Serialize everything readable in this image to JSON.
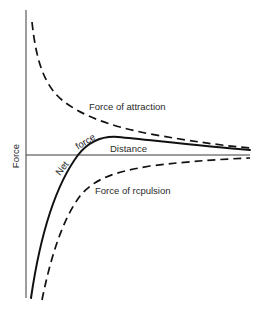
{
  "diagram": {
    "y_axis_label": "Force",
    "x_axis_label": "Distance",
    "curves": {
      "attraction": {
        "label": "Force of attraction",
        "style": "dashed"
      },
      "repulsion": {
        "label": "Force of rcpulsion",
        "style": "dashed"
      },
      "net": {
        "label_part1": "Net",
        "label_part2": "force",
        "style": "solid"
      }
    },
    "colors": {
      "background": "#ffffff",
      "line": "#111111",
      "axis": "#3a3a3a",
      "text": "#2a2a2a"
    }
  }
}
